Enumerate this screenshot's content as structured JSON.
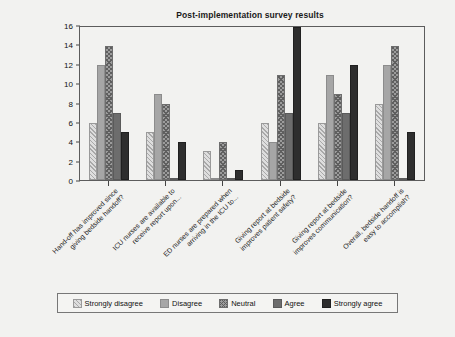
{
  "chart_data": {
    "type": "bar",
    "title": "Post-implementation survey results",
    "xlabel": "",
    "ylabel": "",
    "ylim": [
      0,
      16
    ],
    "ytick_step": 2,
    "yticks": [
      0,
      2,
      4,
      6,
      8,
      10,
      12,
      14,
      16
    ],
    "grid": false,
    "legend_position": "bottom",
    "categories": [
      "Hand-off has improved since giving bedside handoff?",
      "ICU nurses are available to receive report upon...",
      "ED nurses are prepared when arriving in the ICU to...",
      "Giving report at bedside improves patient safety?",
      "Giving report at bedside improves communication?",
      "Overall, bedside handoff is easy to accomplish?"
    ],
    "category_lines": [
      [
        "Hand-off has improved since",
        "giving bedside handoff?"
      ],
      [
        "ICU nurses are available to",
        "receive report upon..."
      ],
      [
        "ED nurses are prepared when",
        "arriving in the ICU to..."
      ],
      [
        "Giving report at bedside",
        "improves patient safety?"
      ],
      [
        "Giving report at bedside",
        "improves communication?"
      ],
      [
        "Overall, bedside handoff is",
        "easy to accomplish?"
      ]
    ],
    "series": [
      {
        "name": "Strongly disagree",
        "color": "#dedede",
        "pattern": "diagonal-hatch",
        "values": [
          6,
          5,
          3,
          6,
          6,
          8
        ]
      },
      {
        "name": "Disagree",
        "color": "#a6a6a6",
        "pattern": "solid",
        "values": [
          12,
          9,
          0,
          4,
          11,
          12
        ]
      },
      {
        "name": "Neutral",
        "color": "#9c9c9c",
        "pattern": "crosshatch",
        "values": [
          14,
          8,
          4,
          11,
          9,
          14
        ]
      },
      {
        "name": "Agree",
        "color": "#6d6d6d",
        "pattern": "solid",
        "values": [
          7,
          0,
          0,
          7,
          7,
          0
        ]
      },
      {
        "name": "Strongly agree",
        "color": "#2e2e2e",
        "pattern": "solid",
        "values": [
          5,
          4,
          1,
          16,
          12,
          5
        ]
      }
    ]
  },
  "legend": {
    "items": [
      {
        "label": "Strongly disagree"
      },
      {
        "label": "Disagree"
      },
      {
        "label": "Neutral"
      },
      {
        "label": "Agree"
      },
      {
        "label": "Strongly agree"
      }
    ]
  }
}
